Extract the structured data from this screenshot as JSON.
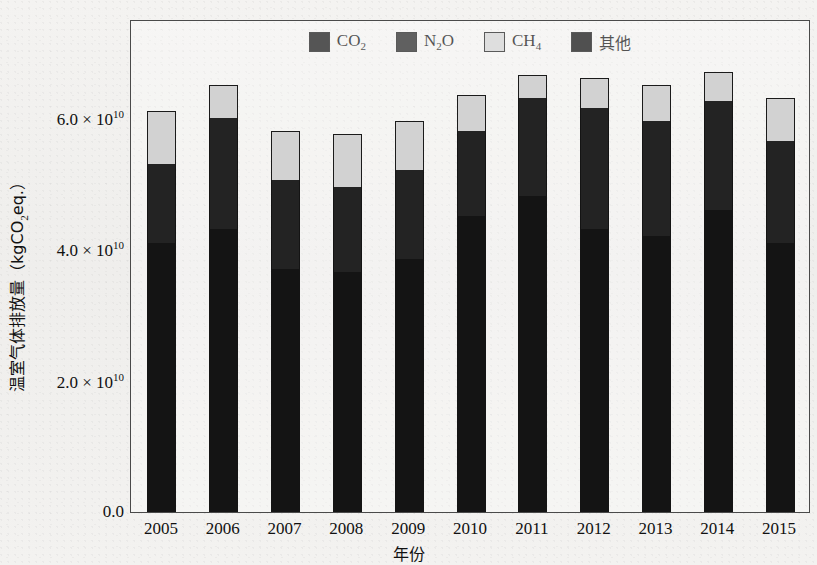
{
  "chart_data": {
    "type": "bar",
    "subtype": "stacked-bar",
    "title": "",
    "xlabel": "年份",
    "ylabel": "温室气体排放量（kgCO2eq.）",
    "ylabel_parts": {
      "pre": "温室气体排放量（kgCO",
      "sub": "2",
      "post": "eq.）"
    },
    "categories": [
      "2005",
      "2006",
      "2007",
      "2008",
      "2009",
      "2010",
      "2011",
      "2012",
      "2013",
      "2014",
      "2015"
    ],
    "ylim": [
      0,
      75000000000.0
    ],
    "yticks": [
      0,
      20000000000,
      40000000000,
      60000000000
    ],
    "ytick_labels": [
      "0.0",
      "2.0 × 10¹⁰",
      "4.0 × 10¹⁰",
      "6.0 × 10¹⁰"
    ],
    "ytick_mantissas": [
      "0.0",
      "2.0",
      "4.0",
      "6.0"
    ],
    "grid": false,
    "legend_position": "top-center",
    "series": [
      {
        "name": "CO2",
        "name_parts": {
          "pre": "CO",
          "sub": "2",
          "post": ""
        },
        "color": "#141414",
        "values": [
          41000000000,
          43000000000,
          37000000000,
          36500000000,
          38500000000,
          45000000000,
          48000000000,
          43000000000,
          42000000000,
          46000000000,
          41000000000
        ]
      },
      {
        "name": "N2O",
        "name_parts": {
          "pre": "N",
          "sub": "2",
          "post": "O"
        },
        "color": "#232323",
        "values": [
          12000000000,
          17000000000,
          13500000000,
          13000000000,
          13500000000,
          13000000000,
          15000000000,
          18500000000,
          17500000000,
          16500000000,
          15500000000
        ]
      },
      {
        "name": "CH4",
        "name_parts": {
          "pre": "CH",
          "sub": "4",
          "post": ""
        },
        "color": "#d2d2d2",
        "values": [
          8000000000,
          5000000000,
          7500000000,
          8000000000,
          7500000000,
          5500000000,
          3500000000,
          4500000000,
          5500000000,
          4500000000,
          6500000000
        ]
      },
      {
        "name": "其他",
        "name_parts": {
          "pre": "其他",
          "sub": "",
          "post": ""
        },
        "color": "#0d0d0d",
        "values": [
          0,
          0,
          0,
          0,
          0,
          0,
          0,
          0,
          0,
          0,
          0
        ]
      }
    ],
    "totals": [
      61000000000,
      65000000000,
      58000000000,
      57500000000,
      59500000000,
      63500000000,
      66500000000,
      66000000000,
      65000000000,
      67000000000,
      63000000000
    ]
  },
  "legend": {
    "entries": [
      {
        "label": "CO2",
        "pre": "CO",
        "sub": "2",
        "post": "",
        "color": "#141414"
      },
      {
        "label": "N2O",
        "pre": "N",
        "sub": "2",
        "post": "O",
        "color": "#232323"
      },
      {
        "label": "CH4",
        "pre": "CH",
        "sub": "4",
        "post": "",
        "color": "#d2d2d2"
      },
      {
        "label": "其他",
        "pre": "其他",
        "sub": "",
        "post": "",
        "color": "#0d0d0d"
      }
    ]
  },
  "axes": {
    "y_axis_title_pre": "温室气体排放量（kgCO",
    "y_axis_title_sub": "2",
    "y_axis_title_post": "eq.）",
    "x_axis_title": "年份"
  }
}
